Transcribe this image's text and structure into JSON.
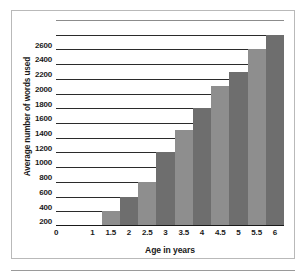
{
  "chart_data": {
    "type": "bar",
    "title": "",
    "subtitle": "",
    "xlabel": "Age in years",
    "ylabel": "Average number of words used",
    "categories": [
      "1.5",
      "2",
      "2.5",
      "3",
      "3.5",
      "4",
      "4.5",
      "5",
      "5.5",
      "6"
    ],
    "values": [
      200,
      400,
      600,
      1000,
      1300,
      1600,
      1900,
      2100,
      2400,
      2600
    ],
    "x": [
      1.5,
      2,
      2.5,
      3,
      3.5,
      4,
      4.5,
      5,
      5.5,
      6
    ],
    "xtick_labels": [
      "0",
      "1",
      "1.5",
      "2",
      "2.5",
      "3",
      "3.5",
      "4",
      "4.5",
      "5",
      "5.5",
      "6"
    ],
    "xtick_values": [
      0,
      1,
      1.5,
      2,
      2.5,
      3,
      3.5,
      4,
      4.5,
      5,
      5.5,
      6
    ],
    "ytick_labels": [
      "200",
      "400",
      "600",
      "800",
      "1000",
      "1200",
      "1400",
      "1600",
      "1800",
      "2000",
      "2200",
      "2400",
      "2600"
    ],
    "ytick_values": [
      200,
      400,
      600,
      800,
      1000,
      1200,
      1400,
      1600,
      1800,
      2000,
      2200,
      2400,
      2600
    ],
    "xlim": [
      0,
      6.25
    ],
    "ylim": [
      0,
      2800
    ],
    "grid": true,
    "legend": null,
    "legend_position": "none",
    "annotations": [],
    "bar_colors": [
      "#8e8e8e",
      "#6e6e6e"
    ],
    "bar_color_pattern": "alternating-light-dark",
    "gridline_color": "#2b2b2b",
    "axis_color": "#1a1a1a",
    "frame_color": "#b9b9b9",
    "background": "#ffffff"
  }
}
